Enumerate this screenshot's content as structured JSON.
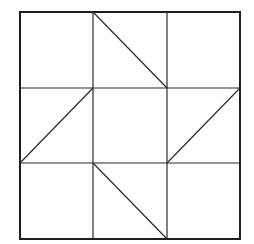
{
  "diagram": {
    "type": "quilt-block-grid",
    "rows": 3,
    "cols": 3,
    "colors": {
      "background": "#ffffff",
      "stroke": "#2a2a2a",
      "border": "#1e1e1e"
    },
    "outer_border": {
      "x1": 20,
      "y1": 12,
      "x2": 240,
      "y2": 239
    },
    "grid_x": [
      20,
      93,
      167,
      240
    ],
    "grid_y": [
      12,
      88,
      163,
      239
    ],
    "cells": [
      {
        "row": 0,
        "col": 0,
        "diagonal": "none"
      },
      {
        "row": 0,
        "col": 1,
        "diagonal": "top-left-to-bottom-right"
      },
      {
        "row": 0,
        "col": 2,
        "diagonal": "none"
      },
      {
        "row": 1,
        "col": 0,
        "diagonal": "top-right-to-bottom-left"
      },
      {
        "row": 1,
        "col": 1,
        "diagonal": "none"
      },
      {
        "row": 1,
        "col": 2,
        "diagonal": "top-right-to-bottom-left"
      },
      {
        "row": 2,
        "col": 0,
        "diagonal": "none"
      },
      {
        "row": 2,
        "col": 1,
        "diagonal": "top-left-to-bottom-right"
      },
      {
        "row": 2,
        "col": 2,
        "diagonal": "none"
      }
    ]
  }
}
